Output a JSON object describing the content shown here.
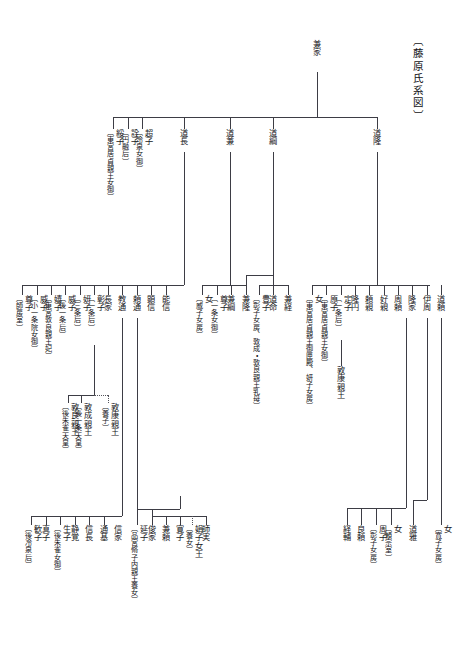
{
  "document": {
    "title": "〔藤原氏系図〕",
    "language": "ja",
    "kind": "genealogy-chart",
    "line_color": "#3d3d45",
    "text_color": "#17171a",
    "background": "#ffffff"
  },
  "root": {
    "name": "兼家",
    "annotation": ""
  },
  "generation2": [
    {
      "name": "綏子",
      "annotation": "〔東宮居貞親王女御〕"
    },
    {
      "name": "詮子",
      "annotation": "〔円融后〕"
    },
    {
      "name": "超子",
      "annotation": "〔冷泉女御〕"
    },
    {
      "name": "道長",
      "annotation": ""
    },
    {
      "name": "道兼",
      "annotation": ""
    },
    {
      "name": "道綱",
      "annotation": ""
    },
    {
      "name": "道隆",
      "annotation": ""
    }
  ],
  "michinaga_children": [
    {
      "name": "尊子",
      "annotation": "〔師房室〕"
    },
    {
      "name": "威子",
      "annotation": "〔小一条院女御〕"
    },
    {
      "name": "嬉子",
      "annotation": "〔東宮敦良親王妃〕"
    },
    {
      "name": "威子",
      "annotation": "〔後一条后〕"
    },
    {
      "name": "妍子",
      "annotation": "〔三条后〕"
    },
    {
      "name": "彰子",
      "annotation": "〔一条后〕"
    },
    {
      "name": "長家",
      "annotation": ""
    },
    {
      "name": "教通",
      "annotation": ""
    },
    {
      "name": "頼通",
      "annotation": ""
    },
    {
      "name": "顕信",
      "annotation": ""
    },
    {
      "name": "能信",
      "annotation": ""
    }
  ],
  "shoshi_children": [
    {
      "name": "敦良親王",
      "annotation": "〔後朱雀天皇〕"
    },
    {
      "name": "敦成親王",
      "annotation": "〔後一条天皇〕"
    },
    {
      "name": "敦康親王",
      "annotation": "〔養子〕"
    }
  ],
  "norimichi_children": [
    {
      "name": "歓子",
      "annotation": "〔後冷泉后〕"
    },
    {
      "name": "真子",
      "annotation": ""
    },
    {
      "name": "生子",
      "annotation": "〔後朱雀女御〕"
    },
    {
      "name": "静覚",
      "annotation": ""
    },
    {
      "name": "信長",
      "annotation": ""
    },
    {
      "name": "通基",
      "annotation": ""
    },
    {
      "name": "信家",
      "annotation": ""
    }
  ],
  "yorimichi_children": [
    {
      "name": "延子",
      "annotation": "〔品宮脩子内親王養女〕"
    },
    {
      "name": "俊家",
      "annotation": ""
    },
    {
      "name": "兼頼",
      "annotation": ""
    },
    {
      "name": "寛子",
      "annotation": ""
    },
    {
      "name": "娟子女王",
      "annotation": "〔養女〕"
    },
    {
      "name": "師実",
      "annotation": ""
    }
  ],
  "michikane_children": [
    {
      "name": "豊子",
      "annotation": "〔彰子女房、敦成・敦良親王乳母〕"
    },
    {
      "name": "道命",
      "annotation": ""
    },
    {
      "name": "兼経",
      "annotation": ""
    }
  ],
  "michitsuna_children": [
    {
      "name": "女",
      "annotation": "〔威子女房〕"
    },
    {
      "name": "尊子",
      "annotation": "〔一条女御〕"
    },
    {
      "name": "兼綱",
      "annotation": ""
    },
    {
      "name": "兼隆",
      "annotation": ""
    }
  ],
  "michitaka_children": [
    {
      "name": "女",
      "annotation": "〔東宮居貞親王御匣殿、妍子女房〕"
    },
    {
      "name": "原子",
      "annotation": "〔東宮居貞親王女御〕"
    },
    {
      "name": "定子",
      "annotation": "〔一条后〕"
    },
    {
      "name": "隆円",
      "annotation": ""
    },
    {
      "name": "頼親",
      "annotation": ""
    },
    {
      "name": "好親",
      "annotation": ""
    },
    {
      "name": "周頼",
      "annotation": ""
    },
    {
      "name": "隆家",
      "annotation": ""
    },
    {
      "name": "伊周",
      "annotation": ""
    },
    {
      "name": "道頼",
      "annotation": ""
    }
  ],
  "teishi_children": [
    {
      "name": "敦康親王",
      "annotation": ""
    },
    {
      "name": "脩子内親王",
      "annotation": ""
    },
    {
      "name": "媄子内親王",
      "annotation": ""
    }
  ],
  "korechika_children": [
    {
      "name": "道雅",
      "annotation": ""
    },
    {
      "name": "女",
      "annotation": "〔寛子女房〕"
    }
  ],
  "takaie_children": [
    {
      "name": "経輔",
      "annotation": ""
    },
    {
      "name": "良頼",
      "annotation": ""
    },
    {
      "name": "周子",
      "annotation": "〔彰子女房〕"
    },
    {
      "name": "女",
      "annotation": "〔頼宗室〕"
    }
  ],
  "nobunaga_branch": [
    {
      "name": "寛子",
      "annotation": "〔寛子女房〕"
    }
  ],
  "yorimune_branch": [
    {
      "name": "延子",
      "annotation": ""
    }
  ]
}
